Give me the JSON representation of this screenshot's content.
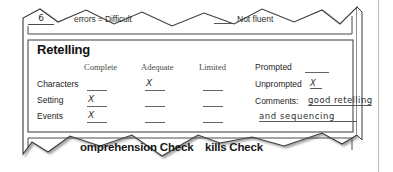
{
  "document": {
    "type": "reading-assessment-form-fragment",
    "paper_color": "#ffffff",
    "ink_color": "#262626"
  },
  "fluency_row": {
    "score_value": "6",
    "errors_label": "errors = Difficult",
    "not_fluent_label": "Not fluent",
    "not_fluent_blank": ""
  },
  "retelling": {
    "title": "Retelling",
    "column_headers": [
      "Complete",
      "Adequate",
      "Limited"
    ],
    "rows": [
      {
        "label": "Characters",
        "marks": [
          "",
          "X",
          ""
        ]
      },
      {
        "label": "Setting",
        "marks": [
          "X",
          "",
          ""
        ]
      },
      {
        "label": "Events",
        "marks": [
          "X",
          "",
          ""
        ]
      }
    ],
    "fields": {
      "prompted_label": "Prompted",
      "prompted_value": "",
      "unprompted_label": "Unprompted",
      "unprompted_value": "X",
      "comments_label": "Comments:",
      "comments_line1": "good retelling",
      "comments_line2": "and sequencing"
    }
  },
  "bottom_sections": {
    "comprehension_check": "omprehension Check",
    "skills_check": "kills Check"
  }
}
